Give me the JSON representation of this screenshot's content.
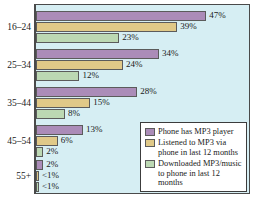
{
  "chart_data": {
    "type": "bar",
    "orientation": "horizontal",
    "title": "",
    "xlabel": "",
    "ylabel": "",
    "xlim": [
      0,
      50
    ],
    "grid": false,
    "legend_position": "lower-right",
    "categories": [
      "16–24",
      "25–34",
      "35–44",
      "45–54",
      "55+"
    ],
    "series": [
      {
        "name": "Phone has MP3 player",
        "color": "#ab8cb8",
        "values": [
          47,
          34,
          28,
          13,
          2
        ],
        "labels": [
          "47%",
          "34%",
          "28%",
          "13%",
          "2%"
        ]
      },
      {
        "name": "Listened to MP3 via phone in last 12 months",
        "color": "#e0c988",
        "values": [
          39,
          24,
          15,
          6,
          0.5
        ],
        "labels": [
          "39%",
          "24%",
          "15%",
          "6%",
          "<1%"
        ]
      },
      {
        "name": "Downloaded MP3/music to phone in last 12 months",
        "color": "#bcd8b3",
        "values": [
          23,
          12,
          8,
          2,
          0.5
        ],
        "labels": [
          "23%",
          "12%",
          "8%",
          "2%",
          "<1%"
        ]
      }
    ]
  },
  "legend": {
    "entries": [
      {
        "label": "Phone has MP3 player",
        "color": "#ab8cb8"
      },
      {
        "label": "Listened to MP3 via phone in last 12 months",
        "color": "#e0c988"
      },
      {
        "label": "Downloaded MP3/music to phone in last 12 months",
        "color": "#bcd8b3"
      }
    ]
  },
  "style": {
    "plot_background": "#d6eef3",
    "page_background": "#ffffff",
    "axis_color": "#4a4a4a",
    "bar_border": "#5b5b5b",
    "text_color": "#1a1a1a"
  }
}
